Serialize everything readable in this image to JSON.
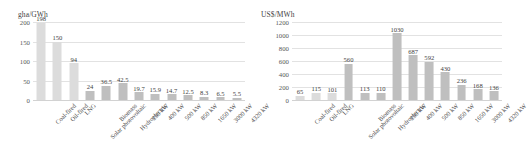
{
  "chart_data": [
    {
      "type": "bar",
      "title": "",
      "ylabel": "gha/GWh",
      "xlabel": "",
      "ylim": [
        0,
        200
      ],
      "yticks": [
        0,
        50,
        100,
        150,
        200
      ],
      "grid": true,
      "legend": "none",
      "categories": [
        "Coal-fired",
        "Oil-fired",
        "LNG",
        "Solar photovoltaic",
        "Biomass",
        "Hydroelectric",
        "250 kW",
        "400 kW",
        "500 kW",
        "850 kW",
        "1650 kW",
        "3000 kW",
        "4320 kW"
      ],
      "values": [
        198,
        150,
        94,
        24,
        36.5,
        42.5,
        19.7,
        15.9,
        14.7,
        12.5,
        8.3,
        6.5,
        5.5
      ],
      "value_labels": [
        "198",
        "150",
        "94",
        "24",
        "36.5",
        "42.5",
        "19.7",
        "15.9",
        "14.7",
        "12.5",
        "8.3",
        "6.5",
        "5.5"
      ],
      "bar_colors": [
        "#dcdcdc",
        "#dcdcdc",
        "#dcdcdc",
        "#bfbfbf",
        "#bfbfbf",
        "#bfbfbf",
        "#bfbfbf",
        "#bfbfbf",
        "#bfbfbf",
        "#bfbfbf",
        "#bfbfbf",
        "#bfbfbf",
        "#bfbfbf"
      ]
    },
    {
      "type": "bar",
      "title": "",
      "ylabel": "US$/MWh",
      "xlabel": "",
      "ylim": [
        0,
        1200
      ],
      "yticks": [
        0,
        200,
        400,
        600,
        800,
        1000,
        1200
      ],
      "grid": true,
      "legend": "none",
      "categories": [
        "Coal-fired",
        "Oil-fired",
        "LNG",
        "Solar photovoltaic",
        "Biomass",
        "Hydroelectric",
        "250 kW",
        "400 kW",
        "500 kW",
        "850 kW",
        "1650 kW",
        "3000 kW",
        "4320 kW"
      ],
      "values": [
        65,
        115,
        101,
        560,
        113,
        110,
        1030,
        687,
        592,
        430,
        236,
        168,
        136
      ],
      "value_labels": [
        "65",
        "115",
        "101",
        "560",
        "113",
        "110",
        "1030",
        "687",
        "592",
        "430",
        "236",
        "168",
        "136"
      ],
      "bar_colors": [
        "#dcdcdc",
        "#dcdcdc",
        "#dcdcdc",
        "#bfbfbf",
        "#bfbfbf",
        "#bfbfbf",
        "#bfbfbf",
        "#bfbfbf",
        "#bfbfbf",
        "#bfbfbf",
        "#bfbfbf",
        "#bfbfbf",
        "#bfbfbf"
      ]
    }
  ]
}
